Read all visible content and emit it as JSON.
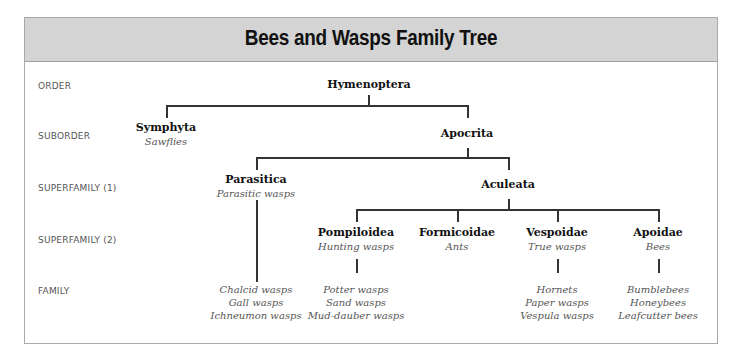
{
  "title": "Bees and Wasps Family Tree",
  "ranks": {
    "order": "ORDER",
    "suborder": "SUBORDER",
    "superfamily1": "SUPERFAMILY (1)",
    "superfamily2": "SUPERFAMILY (2)",
    "family": "FAMILY"
  },
  "nodes": {
    "hymenoptera": {
      "name": "Hymenoptera"
    },
    "symphyta": {
      "name": "Symphyta",
      "common": "Sawflies"
    },
    "apocrita": {
      "name": "Apocrita"
    },
    "parasitica": {
      "name": "Parasitica",
      "common": "Parasitic wasps"
    },
    "aculeata": {
      "name": "Aculeata"
    },
    "pompiloidea": {
      "name": "Pompiloidea",
      "common": "Hunting wasps"
    },
    "formicoidae": {
      "name": "Formicoidae",
      "common": "Ants"
    },
    "vespoidae": {
      "name": "Vespoidae",
      "common": "True wasps"
    },
    "apoidae": {
      "name": "Apoidae",
      "common": "Bees"
    }
  },
  "families": {
    "parasitica": [
      "Chalcid wasps",
      "Gall wasps",
      "Ichneumon wasps"
    ],
    "pompiloidea": [
      "Potter wasps",
      "Sand wasps",
      "Mud-dauber wasps"
    ],
    "vespoidae": [
      "Hornets",
      "Paper wasps",
      "Vespula wasps"
    ],
    "apoidae": [
      "Bumblebees",
      "Honeybees",
      "Leafcutter bees"
    ]
  },
  "colors": {
    "header_bg": "#d4d4d4",
    "line": "#333333",
    "label_gray": "#555555"
  }
}
